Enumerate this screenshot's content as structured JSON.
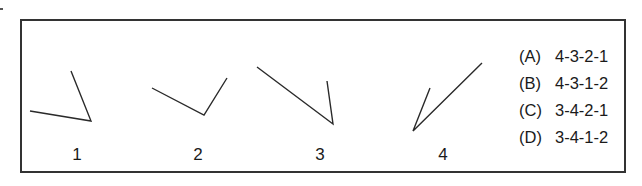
{
  "figures": [
    {
      "label": "1",
      "points": [
        [
          30,
          111
        ],
        [
          91,
          121
        ],
        [
          71,
          71
        ]
      ],
      "label_x": 67
    },
    {
      "label": "2",
      "points": [
        [
          152,
          88
        ],
        [
          204,
          115
        ],
        [
          227,
          78
        ]
      ],
      "label_x": 188
    },
    {
      "label": "3",
      "points": [
        [
          257,
          67
        ],
        [
          333,
          124
        ],
        [
          327,
          81
        ]
      ],
      "label_x": 310
    },
    {
      "label": "4",
      "points": [
        [
          482,
          63
        ],
        [
          413,
          131
        ],
        [
          430,
          88
        ]
      ],
      "label_x": 433
    }
  ],
  "options": [
    {
      "letter": "(A)",
      "value": "4-3-2-1"
    },
    {
      "letter": "(B)",
      "value": "4-3-1-2"
    },
    {
      "letter": "(C)",
      "value": "3-4-2-1"
    },
    {
      "letter": "(D)",
      "value": "3-4-1-2"
    }
  ],
  "colors": {
    "line": "#2a2a2a",
    "frame": "#333333"
  }
}
